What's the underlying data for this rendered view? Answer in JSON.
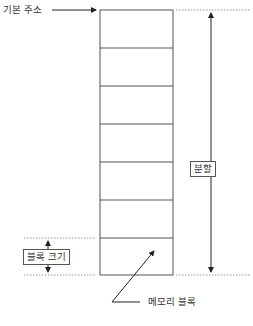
{
  "diagram": {
    "labels": {
      "base_address": "기본 주소",
      "partition": "분할",
      "block_size": "블록 크기",
      "memory_block": "메모리 블록"
    },
    "memory_stack": {
      "block_count": 7
    },
    "colors": {
      "line": "#555555",
      "dotted": "#999999",
      "background": "#ffffff"
    }
  }
}
